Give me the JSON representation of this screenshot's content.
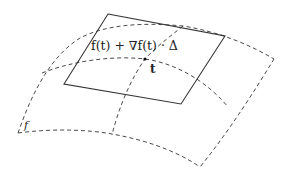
{
  "diagram": {
    "labels": {
      "tangent_plane": "f(t) + ∇f(t) · Δ",
      "point": "t",
      "surface": "f"
    },
    "elements": {
      "surface": "dashed curved surface f",
      "tangent_plane": "solid parallelogram tangent plane",
      "point": "point t where the plane touches the surface"
    },
    "colors": {
      "stroke": "#333333",
      "dashed": "#4a4a4a",
      "background": "#ffffff"
    }
  }
}
